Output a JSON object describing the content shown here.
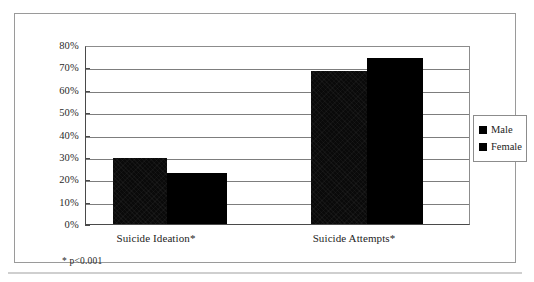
{
  "chart_data": {
    "type": "bar",
    "title": "",
    "subtitle": "",
    "xlabel": "",
    "ylabel": "",
    "categories": [
      "Suicide Ideation*",
      "Suicide Attempts*"
    ],
    "series": [
      {
        "name": "Male",
        "values": [
          30,
          69
        ],
        "color": "#000000"
      },
      {
        "name": "Female",
        "values": [
          23,
          75
        ],
        "color": "#000000"
      }
    ],
    "ylim": [
      0,
      80
    ],
    "ytick_values": [
      0,
      10,
      20,
      30,
      40,
      50,
      60,
      70,
      80
    ],
    "ytick_labels": [
      "0%",
      "10%",
      "20%",
      "30%",
      "40%",
      "50%",
      "60%",
      "70%",
      "80%"
    ],
    "grid": true,
    "grid_axis": "y",
    "legend_position": "right",
    "legend_entries": [
      "Male",
      "Female"
    ],
    "annotations": [
      "* p<0.001"
    ]
  },
  "axis": {
    "ticks": [
      {
        "label": "80%",
        "value": 80
      },
      {
        "label": "70%",
        "value": 70
      },
      {
        "label": "60%",
        "value": 60
      },
      {
        "label": "50%",
        "value": 50
      },
      {
        "label": "40%",
        "value": 40
      },
      {
        "label": "30%",
        "value": 30
      },
      {
        "label": "20%",
        "value": 20
      },
      {
        "label": "10%",
        "value": 10
      },
      {
        "label": "0%",
        "value": 0
      }
    ]
  },
  "categories": [
    {
      "label": "Suicide Ideation*"
    },
    {
      "label": "Suicide Attempts*"
    }
  ],
  "legend": {
    "items": [
      {
        "label": "Male"
      },
      {
        "label": "Female"
      }
    ]
  },
  "footnote": {
    "text": "* p<0.001"
  }
}
